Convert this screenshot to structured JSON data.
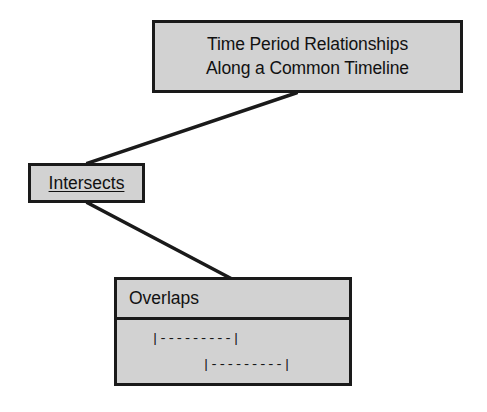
{
  "diagram": {
    "title_node": {
      "name": "time-period-relationships",
      "lines": [
        "Time Period Relationships",
        "Along a Common Timeline"
      ]
    },
    "intersects_node": {
      "label": "Intersects"
    },
    "overlaps_node": {
      "header": "Overlaps",
      "intervals": [
        "|---------|",
        "|---------|"
      ]
    },
    "style": {
      "fill": "#d2d2d2",
      "stroke": "#1a1a1a",
      "background": "#ffffff"
    }
  }
}
